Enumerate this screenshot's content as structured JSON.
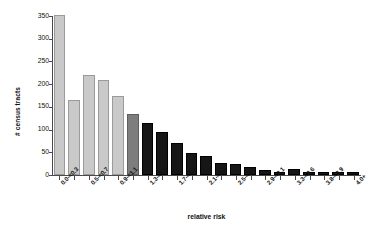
{
  "chart_data": {
    "type": "bar",
    "title": "",
    "xlabel": "relative risk",
    "ylabel": "# census tracts",
    "ylim": [
      0,
      350
    ],
    "yticks": [
      0,
      50,
      100,
      150,
      200,
      250,
      300,
      350
    ],
    "grid": false,
    "legend": null,
    "categories": [
      "0.0-<0.3",
      "0.3-<0.5",
      "0.5-<0.7",
      "0.7-<0.9",
      "0.9-<1.1",
      "1.1-<1.3",
      "1.3-<1.5",
      "1.5-<1.7",
      "1.7-<1.9",
      "1.9-<2.1",
      "2.1-<2.3",
      "2.3-<2.5",
      "2.5-<2.7",
      "2.7-<2.9",
      "2.9-<3.1",
      "3.1-<3.3",
      "3.3-<3.6",
      "3.6-<3.8",
      "3.8-<3.9",
      "3.9-<4.0",
      "4.0+"
    ],
    "tick_labels_shown": [
      "0.0-<0.3",
      "",
      "0.5-<0.7",
      "",
      "0.9-<1.1",
      "",
      "1.3-<1.5",
      "",
      "1.7-<1.9",
      "",
      "2.1-<2.3",
      "",
      "2.5-<2.7",
      "",
      "2.9-<3.1",
      "",
      "3.3-<3.6",
      "",
      "3.8-<3.9",
      "",
      "4.0+"
    ],
    "values": [
      347,
      160,
      216,
      205,
      170,
      130,
      110,
      90,
      67,
      45,
      38,
      22,
      20,
      13,
      7,
      3,
      8,
      2,
      1,
      1,
      3
    ],
    "bar_colors": [
      "#c9c9c9",
      "#c9c9c9",
      "#c9c9c9",
      "#c9c9c9",
      "#c9c9c9",
      "#7d7d7d",
      "#161616",
      "#161616",
      "#161616",
      "#161616",
      "#161616",
      "#161616",
      "#161616",
      "#161616",
      "#161616",
      "#161616",
      "#161616",
      "#161616",
      "#161616",
      "#161616",
      "#161616"
    ],
    "colors": {
      "light_gray": "#c9c9c9",
      "mid_gray": "#7d7d7d",
      "black": "#161616",
      "axis": "#4a4a4a",
      "background": "#ffffff"
    }
  }
}
